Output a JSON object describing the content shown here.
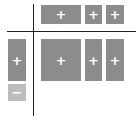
{
  "colors": {
    "box": "#8c8c8c",
    "box_light": "#bdbdbd",
    "line": "#222222",
    "glyph": "#ffffff"
  },
  "column_headers": [
    {
      "icon": "plus-icon",
      "glyph": "+"
    },
    {
      "icon": "plus-icon",
      "glyph": "+"
    },
    {
      "icon": "plus-icon",
      "glyph": "+"
    }
  ],
  "row_headers": [
    {
      "icon": "plus-icon",
      "glyph": "+"
    },
    {
      "icon": "minus-icon",
      "glyph": "−"
    }
  ],
  "cells": [
    {
      "icon": "plus-icon",
      "glyph": "+"
    },
    {
      "icon": "plus-icon",
      "glyph": "+"
    },
    {
      "icon": "plus-icon",
      "glyph": "+"
    }
  ]
}
